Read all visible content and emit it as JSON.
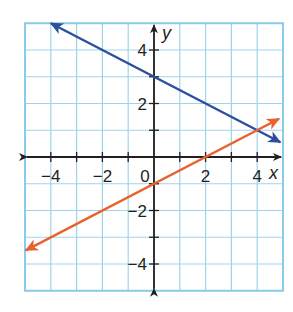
{
  "chart_data": {
    "type": "line",
    "title": "",
    "xlabel": "x",
    "ylabel": "y",
    "xlim": [
      -5,
      5
    ],
    "ylim": [
      -5,
      5
    ],
    "grid": true,
    "x_tick_labels": [
      {
        "value": -4,
        "label": "−4"
      },
      {
        "value": -2,
        "label": "−2"
      },
      {
        "value": 0,
        "label": "0"
      },
      {
        "value": 2,
        "label": "2"
      },
      {
        "value": 4,
        "label": "4"
      }
    ],
    "y_tick_labels": [
      {
        "value": 4,
        "label": "4"
      },
      {
        "value": 2,
        "label": "2"
      },
      {
        "value": -2,
        "label": "−2"
      },
      {
        "value": -4,
        "label": "−4"
      }
    ],
    "series": [
      {
        "name": "blue line",
        "equation": "y = -x/2 + 3",
        "color": "#2b4f9a",
        "x": [
          -4,
          0,
          2,
          4,
          4.9
        ],
        "values": [
          5,
          3,
          2,
          1,
          0.55
        ],
        "arrow_both_ends": true
      },
      {
        "name": "orange line",
        "equation": "y = x/2 - 1",
        "color": "#e8622e",
        "x": [
          -4.97,
          -2,
          0,
          2,
          4,
          4.85
        ],
        "values": [
          -3.49,
          -2,
          -1,
          0,
          1,
          1.43
        ],
        "arrow_both_ends": true
      }
    ],
    "intersection": {
      "x": 4,
      "y": 1
    }
  },
  "colors": {
    "grid": "#9fd3ec",
    "border": "#8ccbe8",
    "axis": "#231f20"
  }
}
